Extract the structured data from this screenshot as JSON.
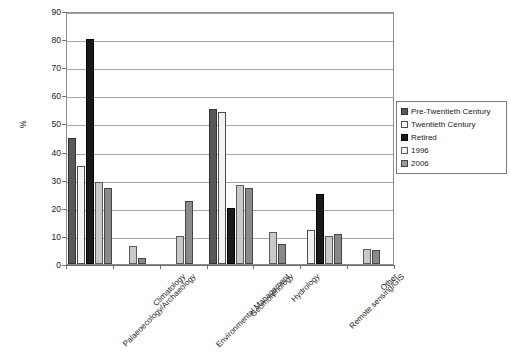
{
  "chart_data": {
    "type": "bar",
    "title": "",
    "xlabel": "",
    "ylabel": "%",
    "ylim": [
      0,
      90
    ],
    "ytick_step": 10,
    "yticks": [
      "0",
      "10",
      "20",
      "30",
      "40",
      "50",
      "60",
      "70",
      "80",
      "90"
    ],
    "grid": true,
    "legend_position": "right",
    "categories": [
      "Palaeoecology/Archaeology",
      "Climatology",
      "Environmental Management",
      "Geomorphology",
      "Hydrology",
      "Remote sensing/GIS",
      "Other"
    ],
    "series": [
      {
        "name": "Pre-Twentieth Century",
        "color": "#595959",
        "values": [
          45,
          0,
          0,
          55,
          0,
          0,
          0
        ]
      },
      {
        "name": "Twentieth Century",
        "color": "#ffffff",
        "values": [
          35,
          0,
          0,
          54,
          0,
          12,
          0
        ]
      },
      {
        "name": "Retired",
        "color": "#1a1a1a",
        "values": [
          80,
          0,
          0,
          20,
          0,
          25,
          0
        ]
      },
      {
        "name": "1996",
        "color": "#c9c9c9",
        "values": [
          29,
          6.5,
          10,
          28,
          11.5,
          10,
          5.5
        ]
      },
      {
        "name": "2006",
        "color": "#8a8a8a",
        "values": [
          27,
          2,
          22.5,
          27,
          7,
          10.5,
          5
        ]
      }
    ]
  },
  "legend": {
    "items": [
      {
        "label": "Pre-Twentieth Century"
      },
      {
        "label": "Twentieth Century"
      },
      {
        "label": "Retired"
      },
      {
        "label": "1996"
      },
      {
        "label": "2006"
      }
    ]
  },
  "axes": {
    "y_title": "%"
  }
}
